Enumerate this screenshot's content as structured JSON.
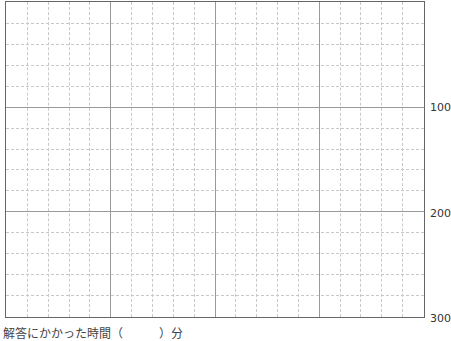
{
  "grid": {
    "columns_major": 4,
    "minor_per_major": 5,
    "rows_major": 3,
    "line_color_major": "#999999",
    "line_color_minor": "#c8c8c8",
    "border_color": "#666666"
  },
  "axis": {
    "ticks": [
      "100",
      "200",
      "300"
    ]
  },
  "caption": {
    "text": "解答にかかった時間（　　　）分",
    "text_uncertain": true
  }
}
